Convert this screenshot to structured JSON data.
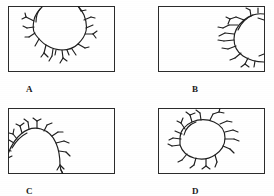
{
  "figure": {
    "background_color": "#ffffff",
    "ink_color": "#2b2b2b",
    "width": 274,
    "height": 196
  },
  "panels": [
    {
      "id": "panel-a",
      "label": "A",
      "label_x": 26,
      "label_y": 85,
      "box": {
        "x": 8,
        "y": 6,
        "w": 107,
        "h": 66
      },
      "description": "Irregular rounded crack outline in the upper middle of the frame, touching the top border, with short branching cracks radiating downward and outward.",
      "blob_position": "top-center",
      "touches_border": "top"
    },
    {
      "id": "panel-b",
      "label": "B",
      "label_x": 192,
      "label_y": 85,
      "box": {
        "x": 158,
        "y": 6,
        "w": 107,
        "h": 66
      },
      "description": "Oval crack outline against the right border of the frame, with branching cracks radiating leftward into the field.",
      "blob_position": "right-edge",
      "touches_border": "right"
    },
    {
      "id": "panel-c",
      "label": "C",
      "label_x": 26,
      "label_y": 187,
      "box": {
        "x": 8,
        "y": 108,
        "w": 107,
        "h": 66
      },
      "description": "Dome-shaped crack outline rising from the bottom-left corner, touching the left and bottom borders, with short spiky branches along its arc.",
      "blob_position": "bottom-left",
      "touches_border": "left-and-bottom"
    },
    {
      "id": "panel-d",
      "label": "D",
      "label_x": 192,
      "label_y": 187,
      "box": {
        "x": 158,
        "y": 108,
        "w": 107,
        "h": 66
      },
      "description": "Closed oval crack outline free-floating in the left half of the frame, with short branching cracks radiating outward all around.",
      "blob_position": "center-left",
      "touches_border": "none"
    }
  ]
}
